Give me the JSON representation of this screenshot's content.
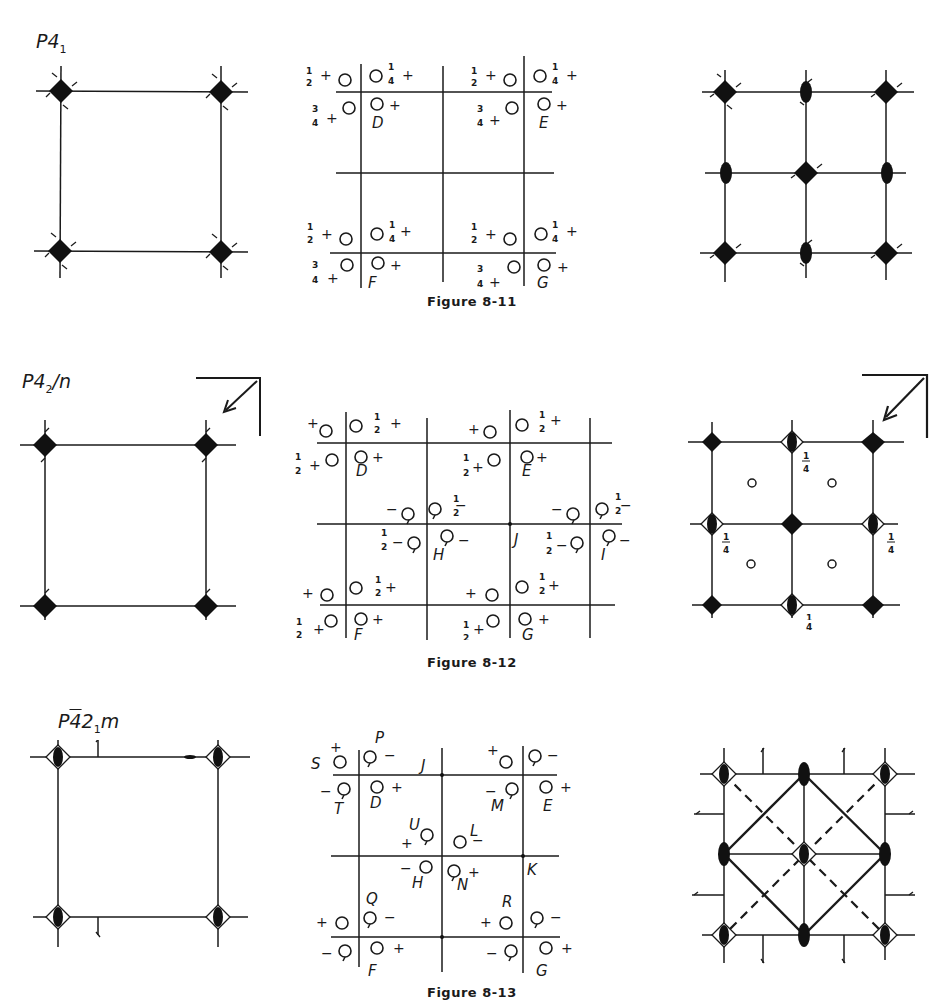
{
  "figures": [
    {
      "id": "8-11",
      "space_group": {
        "base": "P4",
        "sub": "1",
        "rest": ""
      },
      "caption": "Figure 8-11",
      "middle_labels": [
        "D",
        "E",
        "F",
        "G"
      ],
      "fractions": {
        "half": "1/2",
        "quarter": "1/4",
        "three_quarter": "3/4"
      }
    },
    {
      "id": "8-12",
      "space_group": {
        "base": "P4",
        "sub": "2",
        "rest": "/n"
      },
      "caption": "Figure 8-12",
      "middle_labels": [
        "D",
        "E",
        "F",
        "G",
        "H",
        "I",
        "J"
      ],
      "right_fraction_labels": [
        "1/4",
        "1/4",
        "1/4",
        "1/4"
      ]
    },
    {
      "id": "8-13",
      "space_group": {
        "base": "P",
        "bar": "4",
        "sub": "1",
        "mid": "2",
        "rest": "m"
      },
      "caption": "Figure 8-13",
      "middle_labels": [
        "P",
        "S",
        "J",
        "T",
        "D",
        "M",
        "E",
        "U",
        "L",
        "H",
        "N",
        "K",
        "Q",
        "R",
        "F",
        "G"
      ]
    }
  ],
  "text": {
    "f1_label": "P4",
    "f1_sub": "1",
    "f2_label": "P4",
    "f2_sub": "2",
    "f2_rest": "/n",
    "f3_label_p": "P",
    "f3_label_bar4": "4̄",
    "f3_label_2": "2",
    "f3_sub": "1",
    "f3_rest": "m",
    "cap1": "Figure 8-11",
    "cap2": "Figure 8-12",
    "cap3": "Figure 8-13"
  }
}
